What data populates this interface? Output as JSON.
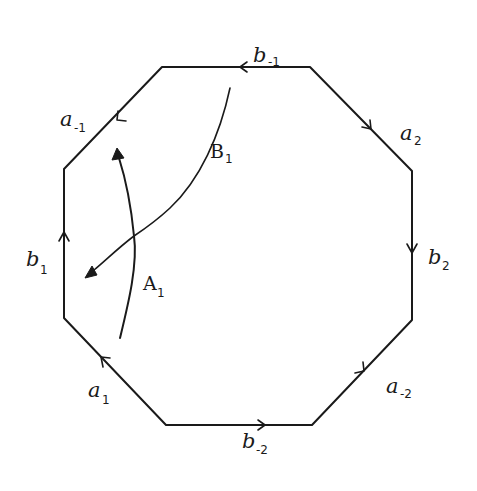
{
  "diagram": {
    "shape": "octagon",
    "stroke_color": "#1a1a1a",
    "background": "#ffffff",
    "edges": [
      {
        "id": "top",
        "base": "b",
        "sub": "-1",
        "direction": "right-to-left"
      },
      {
        "id": "top-right",
        "base": "a",
        "sub": "2",
        "direction": "down-right"
      },
      {
        "id": "right",
        "base": "b",
        "sub": "2",
        "direction": "downward"
      },
      {
        "id": "bottom-right",
        "base": "a",
        "sub": "-2",
        "direction": "up-right"
      },
      {
        "id": "bottom",
        "base": "b",
        "sub": "-2",
        "direction": "left-to-right"
      },
      {
        "id": "bottom-left",
        "base": "a",
        "sub": "1",
        "direction": "up-left"
      },
      {
        "id": "left",
        "base": "b",
        "sub": "1",
        "direction": "upward"
      },
      {
        "id": "top-left",
        "base": "a",
        "sub": "-1",
        "direction": "down-left"
      }
    ],
    "curves": [
      {
        "id": "A1",
        "base": "A",
        "sub": "1",
        "description": "arc from bottom-left region upward, arrow pointing toward edge a-1"
      },
      {
        "id": "B1",
        "base": "B",
        "sub": "1",
        "description": "arc from near top edge down-left, arrow pointing toward edge b1"
      }
    ]
  }
}
